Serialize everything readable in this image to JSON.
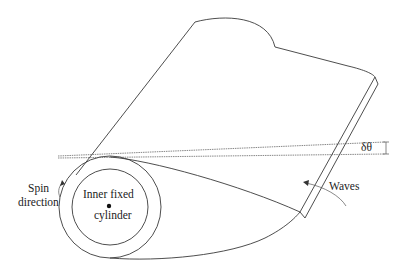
{
  "diagram": {
    "labels": {
      "spin_line1": "Spin",
      "spin_line2": "direction",
      "inner_line1": "Inner fixed",
      "inner_line2": "cylinder",
      "waves": "Waves",
      "angle": "δθ"
    },
    "colors": {
      "stroke": "#3a3a3a",
      "text": "#222222",
      "background": "#ffffff"
    }
  }
}
